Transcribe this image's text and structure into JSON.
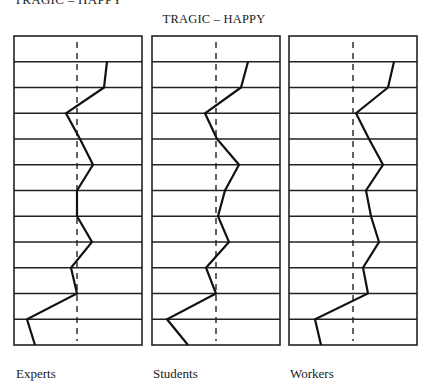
{
  "page": {
    "cropped_heading": "TRAGIC – HAPPY",
    "title": "TRAGIC – HAPPY"
  },
  "chart_data": {
    "type": "line",
    "title": "TRAGIC – HAPPY",
    "xlabel": "",
    "ylabel": "",
    "orientation": "vertical profile (rows top to bottom, horizontal position = rating)",
    "rows": 12,
    "x_range": [
      0,
      128
    ],
    "reference_line": "dashed vertical midline",
    "grid": true,
    "panels": [
      {
        "name": "Experts",
        "left": 14,
        "midline": 63,
        "values": [
          93,
          90,
          52,
          66,
          79,
          63,
          63,
          78,
          57,
          63,
          13,
          21
        ]
      },
      {
        "name": "Students",
        "left": 152,
        "midline": 64,
        "values": [
          96,
          89,
          53,
          65,
          87,
          73,
          66,
          77,
          54,
          64,
          15,
          36
        ]
      },
      {
        "name": "Workers",
        "left": 289,
        "midline": 64,
        "values": [
          105,
          99,
          67,
          80,
          94,
          77,
          82,
          90,
          74,
          79,
          26,
          32
        ]
      }
    ],
    "layout": {
      "top": 36,
      "bottom": 345,
      "panel_width": 128,
      "line_color": "#111111",
      "frame_color": "#222222"
    }
  },
  "labels": {
    "experts": "Experts",
    "students": "Students",
    "workers": "Workers"
  }
}
